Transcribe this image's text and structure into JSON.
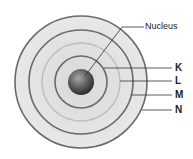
{
  "diagram": {
    "nucleus_label": "Nucleus",
    "shells": [
      {
        "label": "K"
      },
      {
        "label": "L"
      },
      {
        "label": "M"
      },
      {
        "label": "N"
      }
    ],
    "colors": {
      "disc_fill": "#e3e3e3",
      "ring_dark": "#666666",
      "ring_light": "#b8b8b8",
      "nucleus_dark": "#3a3a3a",
      "nucleus_light": "#9a9a9a",
      "leader_line": "#333333"
    }
  }
}
